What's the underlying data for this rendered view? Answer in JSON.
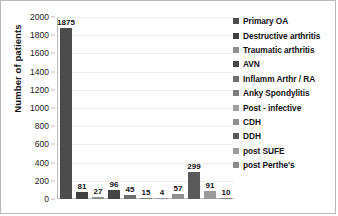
{
  "chart_data": {
    "type": "bar",
    "title": "",
    "xlabel": "",
    "ylabel": "Number of patients",
    "ylim": [
      0,
      2000
    ],
    "ytick_step": 200,
    "yticks": [
      2000,
      1800,
      1600,
      1400,
      1200,
      1000,
      800,
      600,
      400,
      200,
      0
    ],
    "grid": true,
    "legend_position": "right",
    "categories": [
      "Primary OA",
      "Destructive arthritis",
      "Traumatic arthritis",
      "AVN",
      "Inflamm Arthr / RA",
      "Anky Spondylitis",
      "Post - infective",
      "CDH",
      "DDH",
      "post SUFE",
      "post Perthe's"
    ],
    "values": [
      1875,
      81,
      27,
      96,
      45,
      15,
      4,
      57,
      299,
      91,
      10
    ],
    "value_labels": [
      "1875",
      "81",
      "27",
      "96",
      "45",
      "15",
      "4",
      "57",
      "299",
      "91",
      "10"
    ],
    "colors": [
      "#4c4c4c",
      "#3f3f3f",
      "#8e8e8e",
      "#454545",
      "#6e6e6e",
      "#7d7d7d",
      "#a0a0a0",
      "#909090",
      "#5a5a5a",
      "#9a9a9a",
      "#8a8a8a"
    ]
  },
  "legend": {
    "items": [
      {
        "label": "Primary OA",
        "color": "#4c4c4c"
      },
      {
        "label": "Destructive arthritis",
        "color": "#3f3f3f"
      },
      {
        "label": "Traumatic arthritis",
        "color": "#8e8e8e"
      },
      {
        "label": "AVN",
        "color": "#454545"
      },
      {
        "label": "Inflamm Arthr / RA",
        "color": "#6e6e6e"
      },
      {
        "label": "Anky Spondylitis",
        "color": "#7d7d7d"
      },
      {
        "label": "Post - infective",
        "color": "#a0a0a0"
      },
      {
        "label": "CDH",
        "color": "#909090"
      },
      {
        "label": "DDH",
        "color": "#5a5a5a"
      },
      {
        "label": "post SUFE",
        "color": "#9a9a9a"
      },
      {
        "label": "post Perthe's",
        "color": "#8a8a8a"
      }
    ]
  }
}
